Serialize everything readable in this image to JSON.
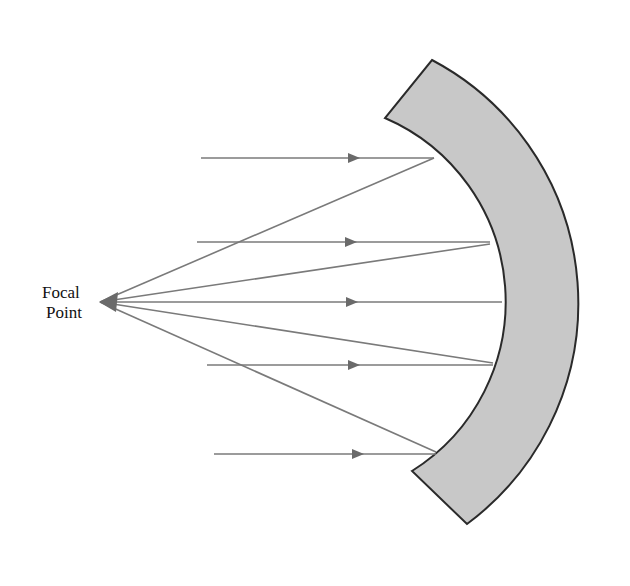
{
  "diagram": {
    "focal_label_line1": "Focal",
    "focal_label_line2": "Point",
    "incoming_ray_count": 5,
    "colors": {
      "mirror_fill": "#c8c8c8",
      "mirror_stroke": "#2a2a2a",
      "ray": "#7a7a7a",
      "arrow": "#6a6a6a"
    }
  }
}
